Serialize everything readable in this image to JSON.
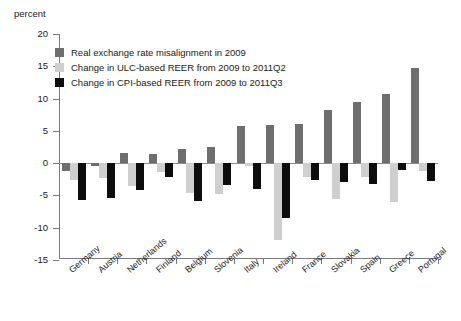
{
  "chart_data": {
    "type": "bar",
    "title": "",
    "ylabel": "percent",
    "xlabel": "",
    "ylim": [
      -15,
      20
    ],
    "yticks": [
      20,
      15,
      10,
      5,
      0,
      -5,
      -10,
      -15
    ],
    "grid": false,
    "legend_position": "top-left",
    "categories": [
      "Germany",
      "Austria",
      "Netherlands",
      "Finland",
      "Belgium",
      "Slovenia",
      "Italy",
      "Ireland",
      "France",
      "Slovakia",
      "Spain",
      "Greece",
      "Portugal"
    ],
    "series": [
      {
        "name": "Real exchange rate misalignment in 2009",
        "color": "#6e6e6e",
        "values": [
          -1.2,
          -0.4,
          1.5,
          1.4,
          2.1,
          2.5,
          5.8,
          5.9,
          6.0,
          8.2,
          9.5,
          10.7,
          14.8
        ]
      },
      {
        "name": "Change in ULC-based REER from 2009 to 2011Q2",
        "color": "#cfcfcf",
        "values": [
          -2.6,
          -2.4,
          -3.6,
          -1.4,
          -4.6,
          -4.8,
          -0.5,
          -12.0,
          -2.1,
          -5.6,
          -2.2,
          -6.0,
          -1.3
        ]
      },
      {
        "name": "Change in CPI-based REER from 2009 to 2011Q3",
        "color": "#0d0d0d",
        "values": [
          -5.8,
          -5.5,
          -4.2,
          -2.1,
          -5.9,
          -3.4,
          -4.1,
          -8.6,
          -2.6,
          -3.0,
          -3.3,
          -1.1,
          -2.8
        ]
      }
    ]
  },
  "legend": {
    "items": [
      {
        "label": "Real exchange rate misalignment in 2009"
      },
      {
        "label": "Change in ULC-based REER from 2009 to 2011Q2"
      },
      {
        "label": "Change in CPI-based REER from 2009 to 2011Q3"
      }
    ]
  }
}
